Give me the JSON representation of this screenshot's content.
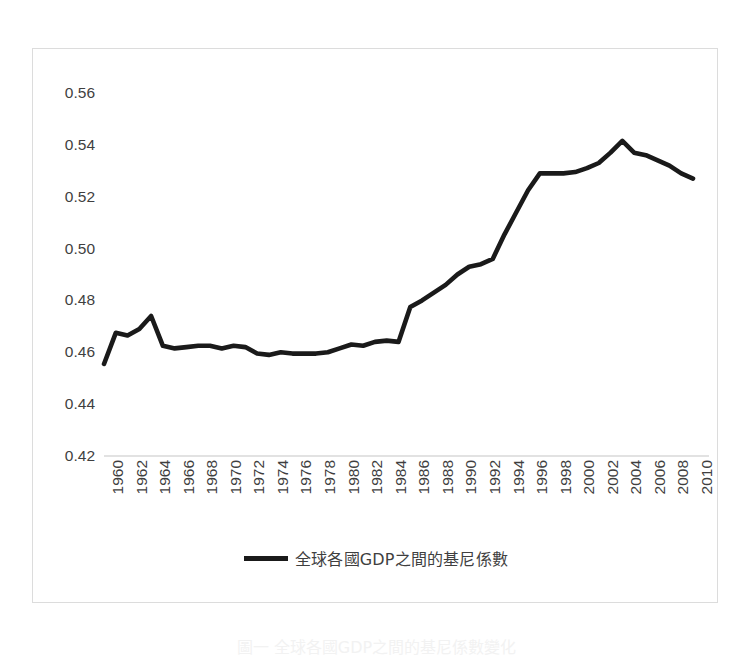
{
  "chart_data": {
    "type": "line",
    "title": "",
    "xlabel": "",
    "ylabel": "",
    "grid": false,
    "legend_position": "bottom",
    "ylim": [
      0.42,
      0.565
    ],
    "yticks": [
      "0.56",
      "0.54",
      "0.52",
      "0.50",
      "0.48",
      "0.46",
      "0.44",
      "0.42"
    ],
    "ytick_values": [
      0.56,
      0.54,
      0.52,
      0.5,
      0.48,
      0.46,
      0.44,
      0.42
    ],
    "xlim": [
      1960,
      2011
    ],
    "xtick_labels": [
      "1960",
      "1962",
      "1964",
      "1966",
      "1968",
      "1970",
      "1972",
      "1974",
      "1976",
      "1978",
      "1980",
      "1982",
      "1984",
      "1986",
      "1988",
      "1990",
      "1992",
      "1994",
      "1996",
      "1998",
      "2000",
      "2002",
      "2004",
      "2006",
      "2008",
      "2010"
    ],
    "series": [
      {
        "name": "全球各國GDP之間的基尼係數",
        "color": "#1a1a1a",
        "x": [
          1960,
          1961,
          1962,
          1963,
          1964,
          1965,
          1966,
          1967,
          1968,
          1969,
          1970,
          1971,
          1972,
          1973,
          1974,
          1975,
          1976,
          1977,
          1978,
          1979,
          1980,
          1981,
          1982,
          1983,
          1984,
          1985,
          1986,
          1987,
          1988,
          1989,
          1990,
          1991,
          1992,
          1993,
          1994,
          1995,
          1996,
          1997,
          1998,
          1999,
          2000,
          2001,
          2002,
          2003,
          2004,
          2005,
          2006,
          2007,
          2008,
          2009,
          2010
        ],
        "values": [
          0.4555,
          0.4675,
          0.4665,
          0.469,
          0.474,
          0.4625,
          0.4615,
          0.462,
          0.4625,
          0.4625,
          0.4615,
          0.4625,
          0.462,
          0.4595,
          0.459,
          0.46,
          0.4595,
          0.4595,
          0.4595,
          0.46,
          0.4615,
          0.463,
          0.4625,
          0.464,
          0.4645,
          0.464,
          0.4775,
          0.48,
          0.483,
          0.486,
          0.49,
          0.493,
          0.494,
          0.496,
          0.5055,
          0.514,
          0.5225,
          0.529,
          0.529,
          0.529,
          0.5295,
          0.531,
          0.533,
          0.537,
          0.5415,
          0.537,
          0.536,
          0.534,
          0.532,
          0.529,
          0.527
        ]
      }
    ]
  },
  "legend": {
    "label": "全球各國GDP之間的基尼係數"
  },
  "caption": {
    "text": "圖一  全球各國GDP之間的基尼係數變化"
  }
}
